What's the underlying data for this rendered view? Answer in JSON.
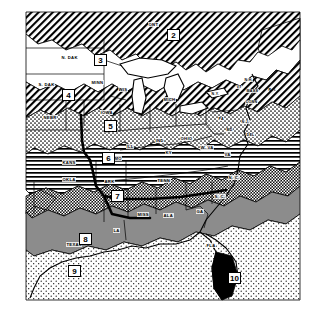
{
  "figure": {
    "kind": "map",
    "background_color": "#ffffff",
    "ink_color": "#000000",
    "width": 321,
    "height": 319
  },
  "zones": [
    {
      "id": "2",
      "number": "2",
      "pattern": "diagonal-hatch-right",
      "fill": "#ffffff",
      "x": 167,
      "y": 29,
      "region": "southern-canada-ontario"
    },
    {
      "id": "3",
      "number": "3",
      "pattern": "solid-white",
      "fill": "#ffffff",
      "x": 94,
      "y": 54,
      "region": "northern-plains"
    },
    {
      "id": "4",
      "number": "4",
      "pattern": "diagonal-hatch-right",
      "fill": "#ffffff",
      "x": 62,
      "y": 89,
      "region": "upper-midwest"
    },
    {
      "id": "5",
      "number": "5",
      "pattern": "stipple-medium",
      "fill": "#ffffff",
      "x": 104,
      "y": 120,
      "region": "central-midwest"
    },
    {
      "id": "6",
      "number": "6",
      "pattern": "horizontal-lines",
      "fill": "#ffffff",
      "x": 102,
      "y": 152,
      "region": "lower-midwest"
    },
    {
      "id": "7",
      "number": "7",
      "pattern": "checker-dense",
      "fill": "#000000",
      "x": 111,
      "y": 190,
      "region": "mid-south-appalachian"
    },
    {
      "id": "8",
      "number": "8",
      "pattern": "gray-solid",
      "fill": "#8c8c8c",
      "x": 79,
      "y": 233,
      "region": "gulf-south"
    },
    {
      "id": "9",
      "number": "9",
      "pattern": "stipple-light",
      "fill": "#ffffff",
      "x": 68,
      "y": 265,
      "region": "south-texas"
    },
    {
      "id": "10",
      "number": "10",
      "pattern": "solid-black",
      "fill": "#000000",
      "x": 228,
      "y": 272,
      "region": "south-florida"
    }
  ],
  "state_labels": [
    {
      "text": "ONT",
      "x": 148,
      "y": 22,
      "rot": 0
    },
    {
      "text": "N. DAK",
      "x": 61,
      "y": 55,
      "rot": 0
    },
    {
      "text": "S. DAK",
      "x": 38,
      "y": 82,
      "rot": 0
    },
    {
      "text": "MINN",
      "x": 91,
      "y": 80,
      "rot": 0
    },
    {
      "text": "WIS",
      "x": 118,
      "y": 87,
      "rot": 0
    },
    {
      "text": "MICH",
      "x": 163,
      "y": 97,
      "rot": 0
    },
    {
      "text": "NEBR",
      "x": 43,
      "y": 115,
      "rot": 0
    },
    {
      "text": "IOWA",
      "x": 100,
      "y": 110,
      "rot": 0
    },
    {
      "text": "ILL",
      "x": 126,
      "y": 144,
      "rot": 0
    },
    {
      "text": "IND",
      "x": 155,
      "y": 138,
      "rot": 0
    },
    {
      "text": "OHIO",
      "x": 180,
      "y": 136,
      "rot": 0
    },
    {
      "text": "PA",
      "x": 218,
      "y": 117,
      "rot": 0
    },
    {
      "text": "N.Y.",
      "x": 211,
      "y": 92,
      "rot": 0
    },
    {
      "text": "VT",
      "x": 236,
      "y": 85,
      "rot": 0
    },
    {
      "text": "N.H.",
      "x": 244,
      "y": 80,
      "rot": 0
    },
    {
      "text": "MASS",
      "x": 246,
      "y": 89,
      "rot": 0
    },
    {
      "text": "CONN",
      "x": 245,
      "y": 100,
      "rot": 0
    },
    {
      "text": "R. I.",
      "x": 268,
      "y": 88,
      "rot": 0
    },
    {
      "text": "N.J.",
      "x": 241,
      "y": 120,
      "rot": 0
    },
    {
      "text": "DEL",
      "x": 246,
      "y": 133,
      "rot": 0
    },
    {
      "text": "MD",
      "x": 226,
      "y": 128,
      "rot": 0
    },
    {
      "text": "KANS",
      "x": 62,
      "y": 160,
      "rot": 0
    },
    {
      "text": "MO",
      "x": 114,
      "y": 156,
      "rot": 0
    },
    {
      "text": "KY",
      "x": 165,
      "y": 150,
      "rot": 0
    },
    {
      "text": "W. VA",
      "x": 200,
      "y": 145,
      "rot": 0
    },
    {
      "text": "VA",
      "x": 224,
      "y": 152,
      "rot": 0
    },
    {
      "text": "OKLA",
      "x": 62,
      "y": 177,
      "rot": 0
    },
    {
      "text": "ARK",
      "x": 104,
      "y": 179,
      "rot": 0
    },
    {
      "text": "TENN",
      "x": 157,
      "y": 178,
      "rot": 0
    },
    {
      "text": "N. C.",
      "x": 228,
      "y": 175,
      "rot": 0
    },
    {
      "text": "S. C.",
      "x": 214,
      "y": 194,
      "rot": 0
    },
    {
      "text": "TEXAS",
      "x": 66,
      "y": 242,
      "rot": 0
    },
    {
      "text": "LA",
      "x": 113,
      "y": 228,
      "rot": 0
    },
    {
      "text": "MISS",
      "x": 137,
      "y": 212,
      "rot": 0
    },
    {
      "text": "ALA",
      "x": 163,
      "y": 213,
      "rot": 0
    },
    {
      "text": "GA",
      "x": 196,
      "y": 209,
      "rot": 0
    },
    {
      "text": "FLA",
      "x": 206,
      "y": 243,
      "rot": 0
    }
  ]
}
